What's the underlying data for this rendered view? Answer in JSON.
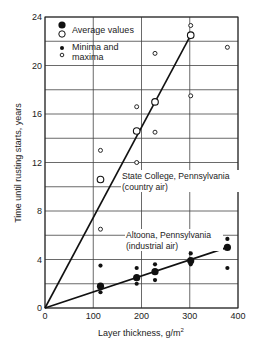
{
  "chart_data": {
    "type": "scatter",
    "title": "",
    "xlabel": "Layer thickness, g/m²",
    "ylabel": "Time until rusting starts, years",
    "xlim": [
      0,
      400
    ],
    "ylim": [
      0,
      24
    ],
    "xticks": [
      0,
      100,
      200,
      300,
      400
    ],
    "yticks": [
      0,
      4,
      8,
      12,
      16,
      20,
      24
    ],
    "grid": true,
    "legend": {
      "position": "upper-left",
      "entries": [
        {
          "marker": "filled-large / open-large",
          "label": "Average values"
        },
        {
          "marker": "filled-small / open-small",
          "label": "Minima and maxima"
        }
      ]
    },
    "series": [
      {
        "name": "State College, Pennsylvania (country air)",
        "marker": "open",
        "averages": [
          {
            "x": 115,
            "y": 10.6
          },
          {
            "x": 190,
            "y": 14.6
          },
          {
            "x": 228,
            "y": 17.0
          },
          {
            "x": 302,
            "y": 22.5
          }
        ],
        "extremes": [
          {
            "x": 115,
            "y": 13.0
          },
          {
            "x": 115,
            "y": 6.5
          },
          {
            "x": 190,
            "y": 16.6
          },
          {
            "x": 190,
            "y": 12.0
          },
          {
            "x": 228,
            "y": 21.0
          },
          {
            "x": 228,
            "y": 14.5
          },
          {
            "x": 302,
            "y": 23.3
          },
          {
            "x": 302,
            "y": 17.5
          },
          {
            "x": 378,
            "y": 21.5
          }
        ],
        "fit_line": {
          "x0": 0,
          "y0": 0,
          "x1": 302,
          "y1": 22.5
        }
      },
      {
        "name": "Altoona, Pennsylvania (industrial air)",
        "marker": "filled",
        "averages": [
          {
            "x": 115,
            "y": 1.8
          },
          {
            "x": 190,
            "y": 2.5
          },
          {
            "x": 228,
            "y": 3.0
          },
          {
            "x": 302,
            "y": 3.9
          },
          {
            "x": 378,
            "y": 5.0
          }
        ],
        "extremes": [
          {
            "x": 115,
            "y": 3.5
          },
          {
            "x": 115,
            "y": 1.3
          },
          {
            "x": 190,
            "y": 3.3
          },
          {
            "x": 190,
            "y": 2.0
          },
          {
            "x": 228,
            "y": 3.6
          },
          {
            "x": 228,
            "y": 2.3
          },
          {
            "x": 302,
            "y": 4.5
          },
          {
            "x": 302,
            "y": 3.6
          },
          {
            "x": 378,
            "y": 5.7
          },
          {
            "x": 378,
            "y": 3.3
          }
        ],
        "fit_line": {
          "x0": 0,
          "y0": 0,
          "x1": 378,
          "y1": 5.0
        }
      }
    ],
    "annotations": [
      {
        "text": "State College, Pennsylvania",
        "line2": "(country air)"
      },
      {
        "text": "Altoona, Pennsylvania",
        "line2": "(industrial air)"
      }
    ]
  },
  "labels": {
    "xlabel": "Layer thickness, g/m",
    "xlabel_sup": "2",
    "ylabel": "Time until rusting starts, years",
    "legend_avg": "Average values",
    "legend_minmax_1": "Minima and",
    "legend_minmax_2": "maxima",
    "annot_sc_1": "State College, Pennsylvania",
    "annot_sc_2": "(country air)",
    "annot_al_1": "Altoona, Pennsylvania",
    "annot_al_2": "(industrial air)"
  }
}
